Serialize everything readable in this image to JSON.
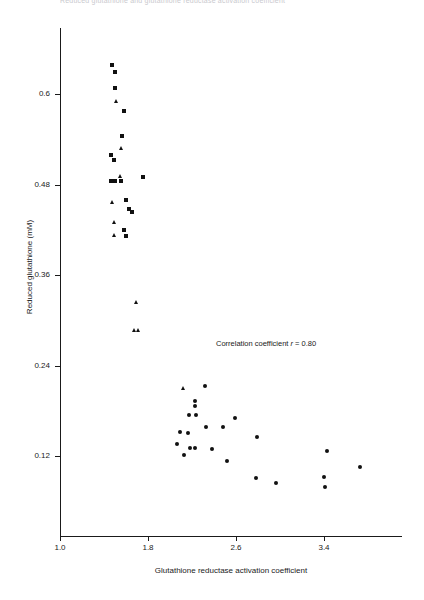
{
  "header_fragment": "Reduced glutathione and glutathione reductase activation coefficient",
  "chart_data": {
    "type": "scatter",
    "title": "",
    "xlabel": "Glutathione reductase activation coefficient",
    "ylabel": "Reduced glutathione (mM)",
    "xlim": [
      1.0,
      3.9
    ],
    "ylim": [
      0.0,
      0.66
    ],
    "xticks": [
      1.0,
      1.8,
      2.6,
      3.4
    ],
    "xticklabels": [
      "1.0",
      "1.8",
      "2.6",
      "3.4"
    ],
    "yticks": [
      0.12,
      0.24,
      0.36,
      0.48,
      0.6
    ],
    "yticklabels": [
      "0.12",
      "0.24",
      "0.36",
      "0.48",
      "0.6"
    ],
    "grid": false,
    "legend": null,
    "annotations": [
      {
        "text_prefix": "Correlation coefficient ",
        "text_symbol": "r",
        "text_suffix": " = 0.80",
        "x": 2.4,
        "y": 0.265
      }
    ],
    "series": [
      {
        "name": "squares",
        "marker": "square",
        "color": "#111111",
        "points": [
          [
            1.47,
            0.638
          ],
          [
            1.5,
            0.629
          ],
          [
            1.5,
            0.608
          ],
          [
            1.577,
            0.578
          ],
          [
            1.56,
            0.545
          ],
          [
            1.462,
            0.519
          ],
          [
            1.489,
            0.512
          ],
          [
            1.462,
            0.485
          ],
          [
            1.5,
            0.485
          ],
          [
            1.557,
            0.485
          ],
          [
            1.756,
            0.49
          ],
          [
            1.6,
            0.459
          ],
          [
            1.625,
            0.448
          ],
          [
            1.655,
            0.443
          ],
          [
            1.577,
            0.42
          ],
          [
            1.6,
            0.412
          ]
        ]
      },
      {
        "name": "triangles",
        "marker": "triangle",
        "color": "#111111",
        "points": [
          [
            1.512,
            0.59
          ],
          [
            1.56,
            0.528
          ],
          [
            1.55,
            0.49
          ],
          [
            1.477,
            0.456
          ],
          [
            1.5,
            0.43
          ],
          [
            1.495,
            0.412
          ],
          [
            1.7,
            0.324
          ],
          [
            1.68,
            0.286
          ],
          [
            1.715,
            0.286
          ],
          [
            2.12,
            0.21
          ]
        ]
      },
      {
        "name": "circles",
        "marker": "circle",
        "color": "#111111",
        "points": [
          [
            2.32,
            0.213
          ],
          [
            2.225,
            0.193
          ],
          [
            2.225,
            0.186
          ],
          [
            2.175,
            0.174
          ],
          [
            2.235,
            0.174
          ],
          [
            2.59,
            0.17
          ],
          [
            2.33,
            0.159
          ],
          [
            2.48,
            0.159
          ],
          [
            2.09,
            0.152
          ],
          [
            2.16,
            0.151
          ],
          [
            2.79,
            0.145
          ],
          [
            2.06,
            0.136
          ],
          [
            2.18,
            0.131
          ],
          [
            2.23,
            0.131
          ],
          [
            2.38,
            0.13
          ],
          [
            3.43,
            0.127
          ],
          [
            2.13,
            0.122
          ],
          [
            2.52,
            0.113
          ],
          [
            3.73,
            0.105
          ],
          [
            2.78,
            0.091
          ],
          [
            3.4,
            0.092
          ],
          [
            2.96,
            0.084
          ],
          [
            3.41,
            0.079
          ]
        ]
      }
    ]
  }
}
